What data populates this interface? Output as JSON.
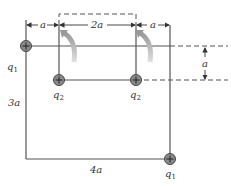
{
  "diagram": {
    "charges": [
      {
        "id": "q1-top-left",
        "label": "q1",
        "sign": "+",
        "x": 26,
        "y": 46
      },
      {
        "id": "q2-left",
        "label": "q2",
        "sign": "+",
        "x": 59,
        "y": 80
      },
      {
        "id": "q2-right",
        "label": "q2",
        "sign": "+",
        "x": 136,
        "y": 80
      },
      {
        "id": "q1-bottom-right",
        "label": "q1",
        "sign": "+",
        "x": 170,
        "y": 160
      }
    ],
    "labels": {
      "q1_top": "q",
      "q1_top_sub": "1",
      "q2_left": "q",
      "q2_left_sub": "2",
      "q2_right": "q",
      "q2_right_sub": "2",
      "q1_bottom": "q",
      "q1_bottom_sub": "1",
      "dim_left_a": "a",
      "dim_middle_2a": "2a",
      "dim_right_a": "a",
      "dim_vertical_a": "a",
      "dim_side_3a": "3a",
      "dim_bottom_4a": "4a"
    },
    "colors": {
      "line": "#555555",
      "charge_fill": "#8a8a8a",
      "charge_stroke": "#444444",
      "rotation_arrow": "#b8b8b8"
    }
  }
}
